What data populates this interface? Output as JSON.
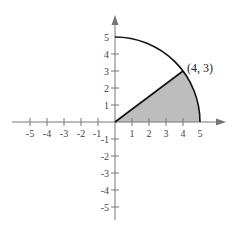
{
  "diagram": {
    "type": "coordinate-plane",
    "x_ticks": [
      "-5",
      "-4",
      "-3",
      "-2",
      "-1",
      "1",
      "2",
      "3",
      "4",
      "5"
    ],
    "y_ticks": [
      "5",
      "4",
      "3",
      "2",
      "1",
      "-1",
      "-2",
      "-3",
      "-4",
      "-5"
    ],
    "point_label": "(4, 3)",
    "radius": 5,
    "point": [
      4,
      3
    ],
    "colors": {
      "axis": "#777777",
      "curve": "#111111",
      "shade": "#bdbdbd"
    }
  }
}
